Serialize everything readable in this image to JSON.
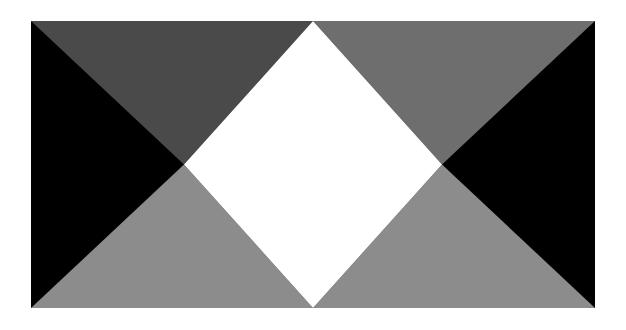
{
  "page": {
    "title": "Geometric Composition",
    "background_color": "#ffffff",
    "width": 626,
    "height": 330
  },
  "artwork": {
    "name": "four-triangle-diamond-composition",
    "frame": {
      "x": 31,
      "y": 21,
      "width": 564,
      "height": 287
    },
    "palette": {
      "black": "#000000",
      "dark_gray": "#4a4a4a",
      "mid_gray": "#6e6e6e",
      "light_gray": "#8c8c8c",
      "white": "#ffffff",
      "background": "#ffffff"
    },
    "regions": [
      {
        "id": "left-black-triangle",
        "label": "Left black triangle",
        "color": "#000000",
        "points": "0,0 0,287 153,143.5"
      },
      {
        "id": "right-black-triangle",
        "label": "Right black triangle",
        "color": "#000000",
        "points": "564,0 564,287 411,143.5"
      },
      {
        "id": "top-dark-gray-triangle",
        "label": "Top left dark gray triangle",
        "color": "#4a4a4a",
        "points": "0,0 282,0 153,143.5"
      },
      {
        "id": "top-mid-gray-triangle",
        "label": "Top right mid gray triangle",
        "color": "#6e6e6e",
        "points": "282,0 564,0 411,143.5"
      },
      {
        "id": "bottom-left-light-gray-triangle",
        "label": "Bottom left light gray triangle",
        "color": "#8c8c8c",
        "points": "0,287 282,287 153,143.5"
      },
      {
        "id": "bottom-right-light-gray-triangle",
        "label": "Bottom right light gray triangle",
        "color": "#8c8c8c",
        "points": "282,287 564,287 411,143.5"
      },
      {
        "id": "center-white-diamond",
        "label": "Center white diamond",
        "color": "#ffffff",
        "points": "282,0 411,143.5 282,287 153,143.5"
      }
    ]
  }
}
